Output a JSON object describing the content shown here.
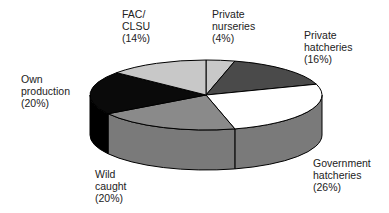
{
  "chart_data": {
    "type": "pie",
    "style": "3d-exploded-none",
    "title": "",
    "categories": [
      "Private nurseries",
      "Private hatcheries",
      "Government hatcheries",
      "Wild caught",
      "Own production",
      "FAC/CLSU"
    ],
    "values": [
      4,
      16,
      26,
      20,
      20,
      14
    ],
    "unit": "%",
    "colors": [
      "#c8c8c8",
      "#4a4a4a",
      "#ffffff",
      "#8a8a8a",
      "#0a0a0a",
      "#c8c8c8"
    ],
    "side_colors": [
      "#a8a8a8",
      "#3a3a3a",
      "#7a7a7a",
      "#7a7a7a",
      "#000000",
      "#a8a8a8"
    ],
    "legend": "none",
    "labels": [
      {
        "lines": [
          "Private",
          "nurseries",
          "(4%)"
        ]
      },
      {
        "lines": [
          "Private",
          "hatcheries",
          "(16%)"
        ]
      },
      {
        "lines": [
          "Government",
          "hatcheries",
          "(26%)"
        ]
      },
      {
        "lines": [
          "Wild",
          "caught",
          "(20%)"
        ]
      },
      {
        "lines": [
          "Own",
          "production",
          "(20%)"
        ]
      },
      {
        "lines": [
          "FAC/",
          "CLSU",
          "(14%)"
        ]
      }
    ]
  }
}
